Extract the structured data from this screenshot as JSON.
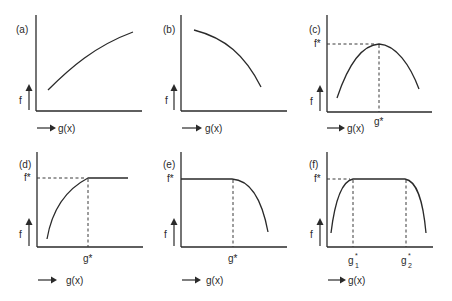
{
  "figure": {
    "panels": [
      {
        "id": "a",
        "label": "(a)",
        "y_axis_label": "f",
        "x_axis_label": "g(x)",
        "shape": "concave increasing"
      },
      {
        "id": "b",
        "label": "(b)",
        "y_axis_label": "f",
        "x_axis_label": "g(x)",
        "shape": "concave decreasing"
      },
      {
        "id": "c",
        "label": "(c)",
        "y_axis_label": "f",
        "x_axis_label": "g(x)",
        "f_star_label": "f*",
        "g_star_label": "g*",
        "shape": "single peak at g*"
      },
      {
        "id": "d",
        "label": "(d)",
        "y_axis_label": "f",
        "x_axis_label": "g(x)",
        "f_star_label": "f*",
        "g_star_label": "g*",
        "shape": "increasing then plateau from g*"
      },
      {
        "id": "e",
        "label": "(e)",
        "y_axis_label": "f",
        "x_axis_label": "g(x)",
        "f_star_label": "f*",
        "g_star_label": "g*",
        "shape": "plateau then decreasing after g*"
      },
      {
        "id": "f",
        "label": "(f)",
        "y_axis_label": "f",
        "x_axis_label": "g(x)",
        "f_star_label": "f*",
        "g1_star_base": "g",
        "g1_star_sup": "*",
        "g1_star_sub": "1",
        "g2_star_base": "g",
        "g2_star_sup": "*",
        "g2_star_sub": "2",
        "shape": "rise, plateau between g1* and g2*, fall"
      }
    ]
  }
}
